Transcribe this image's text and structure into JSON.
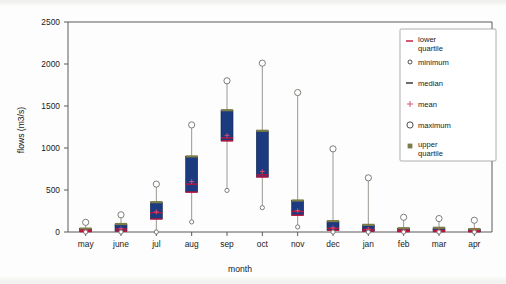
{
  "chart_data": {
    "type": "box",
    "title": "",
    "subtitle": "",
    "xlabel": "month",
    "ylabel": "flows (m3/s)",
    "ylim": [
      0,
      2500
    ],
    "ytick_labels": [
      "0",
      "500",
      "1000",
      "1500",
      "2000",
      "2500"
    ],
    "yticks": [
      0,
      500,
      1000,
      1500,
      2000,
      2500
    ],
    "grid": false,
    "legend_position": "top-right",
    "categories": [
      "may",
      "june",
      "jul",
      "aug",
      "sep",
      "oct",
      "nov",
      "dec",
      "jan",
      "feb",
      "mar",
      "apr"
    ],
    "legend": [
      {
        "label": "lower quartile",
        "marker": "dash",
        "color": "#c2133a"
      },
      {
        "label": "minimum",
        "marker": "small-open-circle",
        "color": "#3a3a3a"
      },
      {
        "label": "median",
        "marker": "dash",
        "color": "#2b2b2b"
      },
      {
        "label": "mean",
        "marker": "plus",
        "color": "#d9536f"
      },
      {
        "label": "maximum",
        "marker": "large-open-circle",
        "color": "#3a3a3a"
      },
      {
        "label": "upper quartile",
        "marker": "square",
        "color": "#7c7c46"
      }
    ],
    "series": [
      {
        "name": "minimum",
        "values": [
          0,
          0,
          0,
          120,
          495,
          290,
          60,
          0,
          0,
          0,
          0,
          0
        ]
      },
      {
        "name": "lower quartile",
        "values": [
          5,
          10,
          155,
          475,
          1085,
          655,
          200,
          20,
          10,
          5,
          5,
          3
        ]
      },
      {
        "name": "median",
        "values": [
          20,
          35,
          230,
          570,
          1120,
          680,
          245,
          45,
          30,
          20,
          18,
          15
        ]
      },
      {
        "name": "mean",
        "values": [
          22,
          40,
          240,
          600,
          1150,
          720,
          255,
          50,
          33,
          22,
          20,
          17
        ]
      },
      {
        "name": "upper quartile",
        "values": [
          40,
          95,
          355,
          900,
          1450,
          1205,
          375,
          130,
          85,
          45,
          50,
          35
        ]
      },
      {
        "name": "maximum",
        "values": [
          115,
          205,
          570,
          1275,
          1800,
          2010,
          1660,
          990,
          645,
          175,
          160,
          140
        ]
      }
    ],
    "colors": {
      "box": "#1b3a80",
      "median": "#c2133a",
      "upper_quartile": "#7c7c46",
      "mean": "#d9536f",
      "whisker": "#8d8d86",
      "axis": "#5b5b5b"
    }
  }
}
